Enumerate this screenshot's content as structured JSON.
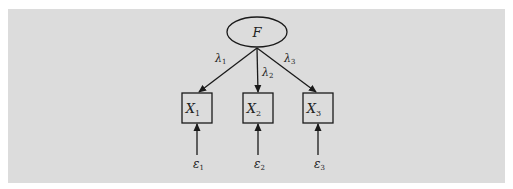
{
  "diagram": {
    "type": "measurement-model",
    "colors": {
      "background": "#dcdcdc",
      "page": "#ffffff",
      "stroke": "#1a1a1a"
    },
    "factor": {
      "label": "F",
      "cx": 257,
      "cy": 32,
      "rx": 30,
      "ry": 15
    },
    "indicators": [
      {
        "label": "X",
        "sub": "1",
        "cx": 197,
        "loading": "λ",
        "loading_sub": "1",
        "error": "ε",
        "error_sub": "1"
      },
      {
        "label": "X",
        "sub": "2",
        "cx": 258,
        "loading": "λ",
        "loading_sub": "2",
        "error": "ε",
        "error_sub": "2"
      },
      {
        "label": "X",
        "sub": "3",
        "cx": 318,
        "loading": "λ",
        "loading_sub": "3",
        "error": "ε",
        "error_sub": "3"
      }
    ]
  }
}
